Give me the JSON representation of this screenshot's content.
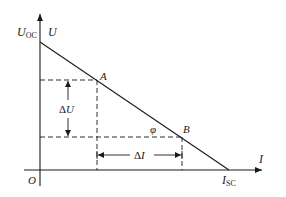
{
  "diagram": {
    "axes": {
      "y_label": "U",
      "y_intercept_label_main": "U",
      "y_intercept_label_sub": "OC",
      "x_label": "I",
      "x_intercept_label_main": "I",
      "x_intercept_label_sub": "SC",
      "origin_label": "O"
    },
    "points": [
      {
        "label": "A"
      },
      {
        "label": "B"
      }
    ],
    "angle_label": "φ",
    "delta_u": {
      "prefix": "Δ",
      "var": "U"
    },
    "delta_i": {
      "prefix": "Δ",
      "var": "I"
    },
    "colors": {
      "line": "#1a1a1a",
      "background": "#ffffff"
    }
  }
}
